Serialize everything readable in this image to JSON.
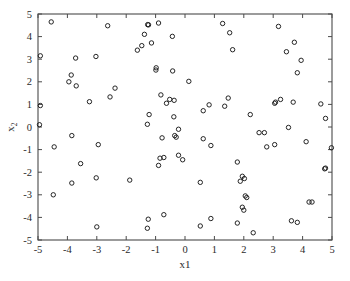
{
  "chart_data": {
    "type": "scatter",
    "title": "",
    "subtitle": "",
    "xlabel": "x1",
    "ylabel": "x2",
    "xlim": [
      -5,
      5
    ],
    "ylim": [
      -5,
      5
    ],
    "xticks": [
      -5,
      -4,
      -3,
      -2,
      -1,
      0,
      1,
      2,
      3,
      4,
      5
    ],
    "yticks": [
      -5,
      -4,
      -3,
      -2,
      -1,
      0,
      1,
      2,
      3,
      4,
      5
    ],
    "xticklabels": [
      "-5",
      "-4",
      "-3",
      "-2",
      "-1",
      "0",
      "1",
      "2",
      "3",
      "4",
      "5"
    ],
    "yticklabels": [
      "-5",
      "-4",
      "-3",
      "-2",
      "-1",
      "0",
      "1",
      "2",
      "3",
      "4",
      "5"
    ],
    "grid": false,
    "legend": null,
    "legend_position": "none",
    "marker": "o",
    "marker_filled": false,
    "marker_color": "#1a1a1a",
    "marker_size": 4.4,
    "n_points": 120,
    "series": [
      {
        "name": "samples",
        "points": [
          [
            -4.55,
            4.65
          ],
          [
            -2.63,
            4.48
          ],
          [
            -1.27,
            4.53
          ],
          [
            -1.24,
            4.52
          ],
          [
            -0.9,
            4.6
          ],
          [
            1.28,
            4.58
          ],
          [
            3.18,
            4.45
          ],
          [
            -1.38,
            4.1
          ],
          [
            1.52,
            4.17
          ],
          [
            -0.43,
            4.01
          ],
          [
            -1.14,
            3.72
          ],
          [
            3.72,
            3.75
          ],
          [
            -1.47,
            3.6
          ],
          [
            -1.62,
            3.4
          ],
          [
            1.62,
            3.42
          ],
          [
            3.45,
            3.33
          ],
          [
            -4.92,
            3.15
          ],
          [
            -3.72,
            3.05
          ],
          [
            -3.03,
            3.12
          ],
          [
            3.95,
            2.95
          ],
          [
            -0.98,
            2.62
          ],
          [
            -0.99,
            2.52
          ],
          [
            -0.42,
            2.48
          ],
          [
            3.82,
            2.4
          ],
          [
            -3.87,
            2.3
          ],
          [
            -3.95,
            2.0
          ],
          [
            -3.7,
            1.82
          ],
          [
            0.13,
            2.02
          ],
          [
            -2.38,
            1.72
          ],
          [
            -0.82,
            1.42
          ],
          [
            -2.55,
            1.33
          ],
          [
            -3.25,
            1.12
          ],
          [
            -0.52,
            1.22
          ],
          [
            -0.37,
            1.18
          ],
          [
            -0.63,
            1.05
          ],
          [
            1.47,
            1.28
          ],
          [
            3.25,
            1.22
          ],
          [
            3.08,
            1.1
          ],
          [
            3.05,
            1.05
          ],
          [
            0.82,
            0.98
          ],
          [
            1.35,
            0.92
          ],
          [
            3.68,
            1.1
          ],
          [
            4.62,
            1.02
          ],
          [
            -4.92,
            0.95
          ],
          [
            0.62,
            0.72
          ],
          [
            -1.22,
            0.55
          ],
          [
            -0.38,
            0.45
          ],
          [
            2.22,
            0.55
          ],
          [
            4.78,
            0.38
          ],
          [
            -1.28,
            0.12
          ],
          [
            -4.95,
            0.1
          ],
          [
            -0.22,
            -0.1
          ],
          [
            3.52,
            -0.02
          ],
          [
            -0.35,
            -0.38
          ],
          [
            -3.85,
            -0.38
          ],
          [
            -0.3,
            -0.45
          ],
          [
            -0.78,
            -0.48
          ],
          [
            2.52,
            -0.25
          ],
          [
            2.7,
            -0.25
          ],
          [
            0.62,
            -0.52
          ],
          [
            -4.45,
            -0.88
          ],
          [
            -2.95,
            -0.78
          ],
          [
            0.88,
            -0.82
          ],
          [
            2.78,
            -0.88
          ],
          [
            3.05,
            -0.78
          ],
          [
            4.12,
            -0.65
          ],
          [
            4.98,
            -0.92
          ],
          [
            -0.22,
            -1.25
          ],
          [
            -0.85,
            -1.38
          ],
          [
            -0.72,
            -1.35
          ],
          [
            -0.08,
            -1.45
          ],
          [
            1.78,
            -1.55
          ],
          [
            -3.55,
            -1.62
          ],
          [
            -0.9,
            -1.7
          ],
          [
            4.75,
            -1.85
          ],
          [
            4.78,
            -1.82
          ],
          [
            -3.02,
            -2.25
          ],
          [
            1.95,
            -2.18
          ],
          [
            2.02,
            -2.28
          ],
          [
            -3.85,
            -2.48
          ],
          [
            -1.88,
            -2.35
          ],
          [
            0.52,
            -2.45
          ],
          [
            1.88,
            -2.4
          ],
          [
            2.05,
            -3.05
          ],
          [
            2.1,
            -3.12
          ],
          [
            -4.48,
            -3.0
          ],
          [
            4.22,
            -3.32
          ],
          [
            4.32,
            -3.32
          ],
          [
            1.95,
            -3.55
          ],
          [
            2.0,
            -3.68
          ],
          [
            -1.25,
            -4.08
          ],
          [
            0.88,
            -4.05
          ],
          [
            -0.72,
            -3.88
          ],
          [
            3.62,
            -4.15
          ],
          [
            3.82,
            -4.22
          ],
          [
            1.78,
            -4.25
          ],
          [
            -1.28,
            -4.48
          ],
          [
            0.52,
            -4.38
          ],
          [
            -3.0,
            -4.42
          ],
          [
            2.32,
            -4.68
          ]
        ]
      }
    ]
  },
  "figure": {
    "background_color": "#ffffff",
    "axis_color": "#4a4a4a",
    "marker_stroke": "#1a1a1a"
  }
}
